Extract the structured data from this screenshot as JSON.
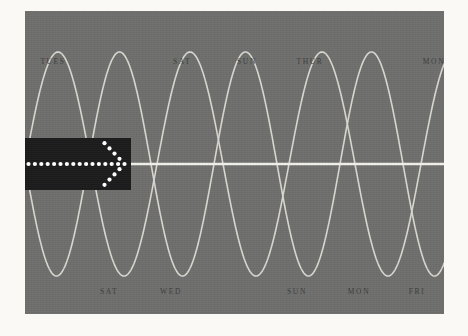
{
  "figure": {
    "background_color": "#faf9f6",
    "panel_color": "#6e6f6d",
    "curve_color": "#d8d6cf",
    "axis_line_color": "#f0efe9",
    "label_color": "#3c3c3a",
    "overlay_color": "#1b1b1b",
    "dot_color": "#ffffff"
  },
  "crest_labels": [
    {
      "text": "TUES",
      "x": 28
    },
    {
      "text": "SAT",
      "x": 157
    },
    {
      "text": "SUN",
      "x": 222
    },
    {
      "text": "THUR",
      "x": 285
    },
    {
      "text": "MON",
      "x": 409
    }
  ],
  "trough_labels": [
    {
      "text": "SAT",
      "x": 84
    },
    {
      "text": "WED",
      "x": 146
    },
    {
      "text": "SUN",
      "x": 272
    },
    {
      "text": "MON",
      "x": 334
    },
    {
      "text": "FRI",
      "x": 392
    }
  ],
  "overlay": {
    "name": "arrow-right",
    "shaft_dot_count": 15,
    "head_dot_count": 8
  },
  "chart_data": {
    "type": "line",
    "title": "",
    "xlabel": "",
    "ylabel": "",
    "grid": false,
    "legend": "none",
    "xlim": [
      0,
      419
    ],
    "ylim": [
      -1,
      1
    ],
    "axis_line_y": 0,
    "series": [
      {
        "name": "wave-a",
        "form": "sine",
        "amplitude": 1,
        "period_px": 132,
        "phase_px": 0,
        "crest_x": [
          28,
          157,
          285,
          409
        ],
        "trough_x": [
          84,
          222,
          350
        ]
      },
      {
        "name": "wave-b",
        "form": "sine",
        "amplitude": 1,
        "period_px": 126,
        "phase_px": 63,
        "crest_x": [
          95,
          222,
          348
        ],
        "trough_x": [
          33,
          146,
          272,
          392
        ]
      }
    ],
    "tick_labels_top": [
      "TUES",
      "SAT",
      "SUN",
      "THUR",
      "MON"
    ],
    "tick_labels_bottom": [
      "SAT",
      "WED",
      "SUN",
      "MON",
      "FRI"
    ]
  }
}
